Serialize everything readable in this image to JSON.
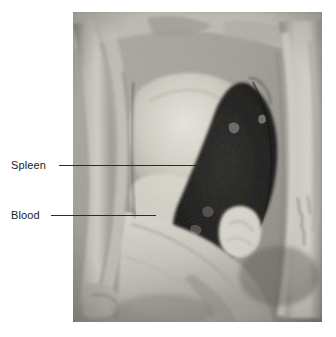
{
  "figure": {
    "type": "annotated-photograph",
    "background_color": "#ffffff",
    "photo": {
      "name": "autopsy-photograph",
      "x": 73,
      "y": 12,
      "width": 249,
      "height": 310,
      "rendering": "grayscale",
      "tones": {
        "highlight": "#e8e6e0",
        "midtone": "#a9a69f",
        "shadow": "#57544f",
        "deep_shadow": "#191816"
      },
      "regions": [
        {
          "name": "left-arm",
          "description": "pale limb along left margin"
        },
        {
          "name": "reflected-skin-flap",
          "description": "light tissue flap draped over lower torso"
        },
        {
          "name": "pale-organ-mass",
          "description": "large light-toned viscera upper centre"
        },
        {
          "name": "blood-filled-cavity",
          "description": "very dark region right of centre"
        },
        {
          "name": "right-arm",
          "description": "pale limb along right margin with faint ink marking"
        }
      ]
    }
  },
  "annotations": [
    {
      "id": "spleen",
      "label": "Spleen",
      "label_x": 11,
      "label_y": 158,
      "leader": {
        "x": 59,
        "y": 165,
        "length": 152
      },
      "text_color": "#1b1b1b",
      "line_color": "#2b2b2b"
    },
    {
      "id": "blood",
      "label": "Blood",
      "label_x": 11,
      "label_y": 208,
      "leader": {
        "x": 51,
        "y": 215,
        "length": 105
      },
      "text_color": "#1b1b1b",
      "line_color": "#2b2b2b"
    }
  ]
}
